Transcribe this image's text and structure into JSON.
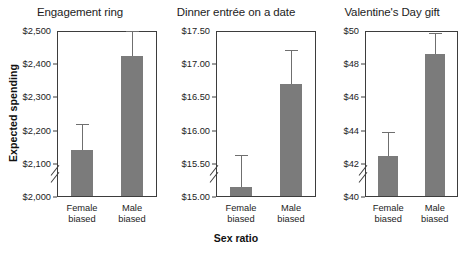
{
  "figure": {
    "xlabel": "Sex ratio",
    "ylabel": "Expected spending",
    "bar_color": "#7b7b7b",
    "axis_color": "#3d3d3d"
  },
  "chart_data": [
    {
      "type": "bar",
      "title": "Engagement ring",
      "xlabel": "Sex ratio",
      "ylabel": "Expected spending",
      "ylim": [
        2000,
        2500
      ],
      "axis_break": true,
      "grid": false,
      "legend": "none",
      "categories": [
        "Female biased",
        "Male biased"
      ],
      "tick_labels": [
        "$2,000",
        "$2,100",
        "$2,200",
        "$2,300",
        "$2,400",
        "$2,500"
      ],
      "tick_values": [
        2000,
        2100,
        2200,
        2300,
        2400,
        2500
      ],
      "values": [
        2143,
        2424
      ],
      "error_high": [
        2220,
        2500
      ],
      "error_low": [
        2143,
        2424
      ]
    },
    {
      "type": "bar",
      "title": "Dinner entrée on a date",
      "xlabel": "Sex ratio",
      "ylabel": "Expected spending",
      "ylim": [
        15.0,
        17.5
      ],
      "axis_break": true,
      "grid": false,
      "legend": "none",
      "categories": [
        "Female biased",
        "Male biased"
      ],
      "tick_labels": [
        "$15.00",
        "$15.50",
        "$16.00",
        "$16.50",
        "$17.00",
        "$17.50"
      ],
      "tick_values": [
        15.0,
        15.5,
        16.0,
        16.5,
        17.0,
        17.5
      ],
      "values": [
        15.15,
        16.7
      ],
      "error_high": [
        15.63,
        17.22
      ],
      "error_low": [
        15.15,
        16.7
      ]
    },
    {
      "type": "bar",
      "title": "Valentine's Day gift",
      "xlabel": "Sex ratio",
      "ylabel": "Expected spending",
      "ylim": [
        40,
        50
      ],
      "axis_break": true,
      "grid": false,
      "legend": "none",
      "categories": [
        "Female biased",
        "Male biased"
      ],
      "tick_labels": [
        "$40",
        "$42",
        "$44",
        "$46",
        "$48",
        "$50"
      ],
      "tick_values": [
        40,
        42,
        44,
        46,
        48,
        50
      ],
      "values": [
        42.45,
        48.6
      ],
      "error_high": [
        43.9,
        49.9
      ],
      "error_low": [
        42.45,
        48.6
      ]
    }
  ]
}
